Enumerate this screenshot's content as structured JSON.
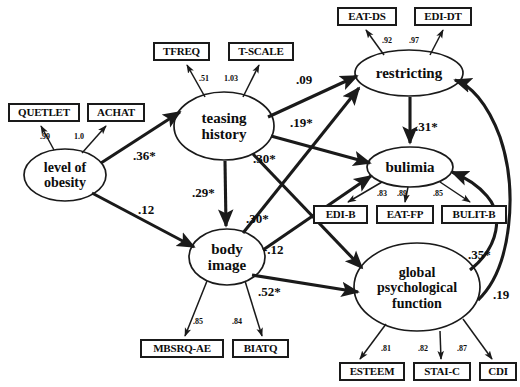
{
  "diagram": {
    "type": "structural-equation-model-path-diagram",
    "title": "",
    "colors": {
      "stroke": "#1a1a1a",
      "text": "#0d0d0d",
      "background": "#ffffff"
    }
  },
  "latent_variables": [
    {
      "id": "obesity",
      "label_lines": [
        "level of",
        "obesity"
      ],
      "cx": 65,
      "cy": 175,
      "rx": 41,
      "ry": 26,
      "font_size": 14
    },
    {
      "id": "teasing",
      "label_lines": [
        "teasing",
        "history"
      ],
      "cx": 224,
      "cy": 126,
      "rx": 50,
      "ry": 34,
      "font_size": 15
    },
    {
      "id": "body",
      "label_lines": [
        "body",
        "image"
      ],
      "cx": 227,
      "cy": 257,
      "rx": 38,
      "ry": 28,
      "font_size": 15
    },
    {
      "id": "restricting",
      "label_lines": [
        "restricting"
      ],
      "cx": 409,
      "cy": 73,
      "rx": 54,
      "ry": 23,
      "font_size": 15
    },
    {
      "id": "bulimia",
      "label_lines": [
        "bulimia"
      ],
      "cx": 410,
      "cy": 167,
      "rx": 43,
      "ry": 20,
      "font_size": 15
    },
    {
      "id": "global",
      "label_lines": [
        "global",
        "psychological",
        "function"
      ],
      "cx": 417,
      "cy": 287,
      "rx": 63,
      "ry": 44,
      "font_size": 14
    }
  ],
  "observed_variables": [
    {
      "id": "quetlet",
      "label": "QUETLET",
      "x": 8,
      "y": 103,
      "w": 72,
      "h": 19
    },
    {
      "id": "achat",
      "label": "ACHAT",
      "x": 87,
      "y": 103,
      "w": 58,
      "h": 19
    },
    {
      "id": "tfreq",
      "label": "TFREQ",
      "x": 153,
      "y": 42,
      "w": 57,
      "h": 19
    },
    {
      "id": "tscale",
      "label": "T-SCALE",
      "x": 228,
      "y": 42,
      "w": 66,
      "h": 19
    },
    {
      "id": "eatds",
      "label": "EAT-DS",
      "x": 337,
      "y": 7,
      "w": 60,
      "h": 19
    },
    {
      "id": "edidt",
      "label": "EDI-DT",
      "x": 414,
      "y": 7,
      "w": 58,
      "h": 19
    },
    {
      "id": "edib",
      "label": "EDI-B",
      "x": 313,
      "y": 205,
      "w": 55,
      "h": 19
    },
    {
      "id": "eatfp",
      "label": "EAT-FP",
      "x": 376,
      "y": 205,
      "w": 58,
      "h": 19
    },
    {
      "id": "bulitb",
      "label": "BULIT-B",
      "x": 441,
      "y": 205,
      "w": 66,
      "h": 19
    },
    {
      "id": "mbsrqae",
      "label": "MBSRQ-AE",
      "x": 140,
      "y": 339,
      "w": 84,
      "h": 19
    },
    {
      "id": "biatq",
      "label": "BIATQ",
      "x": 232,
      "y": 339,
      "w": 57,
      "h": 19
    },
    {
      "id": "esteem",
      "label": "ESTEEM",
      "x": 339,
      "y": 362,
      "w": 66,
      "h": 19
    },
    {
      "id": "staic",
      "label": "STAI-C",
      "x": 413,
      "y": 362,
      "w": 58,
      "h": 19
    },
    {
      "id": "cdi",
      "label": "CDI",
      "x": 479,
      "y": 362,
      "w": 38,
      "h": 19
    }
  ],
  "measurement_loadings": [
    {
      "from": "obesity",
      "to": "quetlet",
      "value": ".99",
      "lx": 40,
      "ly": 133
    },
    {
      "from": "obesity",
      "to": "achat",
      "value": "1.0",
      "lx": 74,
      "ly": 133
    },
    {
      "from": "teasing",
      "to": "tfreq",
      "value": ".51",
      "lx": 199,
      "ly": 75
    },
    {
      "from": "teasing",
      "to": "tscale",
      "value": "1.03",
      "lx": 224,
      "ly": 75
    },
    {
      "from": "restricting",
      "to": "eatds",
      "value": ".92",
      "lx": 382,
      "ly": 37
    },
    {
      "from": "restricting",
      "to": "edidt",
      "value": ".97",
      "lx": 409,
      "ly": 37
    },
    {
      "from": "bulimia",
      "to": "edib",
      "value": ".83",
      "lx": 377,
      "ly": 190
    },
    {
      "from": "bulimia",
      "to": "eatfp",
      "value": ".89",
      "lx": 397,
      "ly": 190
    },
    {
      "from": "bulimia",
      "to": "bulitb",
      "value": ".85",
      "lx": 433,
      "ly": 190
    },
    {
      "from": "body",
      "to": "mbsrqae",
      "value": ".85",
      "lx": 193,
      "ly": 318
    },
    {
      "from": "body",
      "to": "biatq",
      "value": ".84",
      "lx": 232,
      "ly": 318
    },
    {
      "from": "global",
      "to": "esteem",
      "value": ".81",
      "lx": 381,
      "ly": 345
    },
    {
      "from": "global",
      "to": "staic",
      "value": ".82",
      "lx": 418,
      "ly": 345
    },
    {
      "from": "global",
      "to": "cdi",
      "value": ".87",
      "lx": 457,
      "ly": 345
    }
  ],
  "structural_paths": [
    {
      "from": "obesity",
      "to": "teasing",
      "value": ".36*",
      "lx": 133,
      "ly": 149,
      "significant": true
    },
    {
      "from": "obesity",
      "to": "body",
      "value": ".12",
      "lx": 138,
      "ly": 203,
      "significant": false
    },
    {
      "from": "teasing",
      "to": "body",
      "value": ".29*",
      "lx": 192,
      "ly": 186,
      "significant": true
    },
    {
      "from": "teasing",
      "to": "restricting",
      "value": ".09",
      "lx": 296,
      "ly": 73,
      "significant": false
    },
    {
      "from": "teasing",
      "to": "bulimia",
      "value": ".19*",
      "lx": 290,
      "ly": 116,
      "significant": true
    },
    {
      "from": "teasing",
      "to": "global",
      "value": ".30*",
      "lx": 253,
      "ly": 152,
      "significant": true
    },
    {
      "from": "body",
      "to": "restricting",
      "value": ".30*",
      "lx": 246,
      "ly": 212,
      "significant": true
    },
    {
      "from": "body",
      "to": "bulimia",
      "value": "-.12",
      "lx": 263,
      "ly": 243,
      "significant": false
    },
    {
      "from": "body",
      "to": "global",
      "value": ".52*",
      "lx": 258,
      "ly": 285,
      "significant": true
    },
    {
      "from": "restricting",
      "to": "bulimia",
      "value": ".31*",
      "lx": 415,
      "ly": 120,
      "significant": true
    },
    {
      "from": "global",
      "to": "bulimia",
      "value": ".35*",
      "lx": 468,
      "ly": 248,
      "significant": true
    },
    {
      "from": "global",
      "to": "restricting",
      "value": ".19",
      "lx": 493,
      "ly": 288,
      "significant": false
    }
  ],
  "legend": {
    "note": "* denotes statistically significant path"
  }
}
